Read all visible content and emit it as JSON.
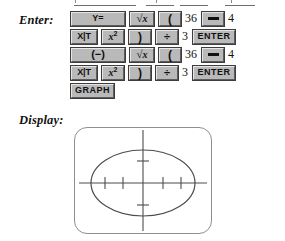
{
  "labels": {
    "enter": "Enter:",
    "display": "Display:"
  },
  "keystrokes": {
    "rows": [
      {
        "items": [
          {
            "kind": "key",
            "name": "y-equals-key",
            "label": "Y=",
            "style": "wide"
          },
          {
            "kind": "key",
            "name": "square-root-key",
            "label": "√x",
            "style": "sqrt"
          },
          {
            "kind": "key",
            "name": "left-paren-key",
            "label": "(",
            "style": "paren"
          },
          {
            "kind": "num",
            "name": "typed-number",
            "label": "36"
          },
          {
            "kind": "key",
            "name": "minus-key",
            "label": "−",
            "style": "minus"
          },
          {
            "kind": "num",
            "name": "typed-number",
            "label": "4"
          }
        ]
      },
      {
        "items": [
          {
            "kind": "key",
            "name": "x-variable-key",
            "label": "X|T",
            "style": "xit"
          },
          {
            "kind": "key",
            "name": "x-squared-key",
            "label": "x2",
            "style": "sq"
          },
          {
            "kind": "key",
            "name": "right-paren-key",
            "label": ")",
            "style": "paren"
          },
          {
            "kind": "key",
            "name": "divide-key",
            "label": "÷",
            "style": "div"
          },
          {
            "kind": "num",
            "name": "typed-number",
            "label": "3"
          },
          {
            "kind": "key",
            "name": "enter-key",
            "label": "ENTER",
            "style": "enter"
          }
        ]
      },
      {
        "items": [
          {
            "kind": "key",
            "name": "negative-key",
            "label": "(−)",
            "style": "neg"
          },
          {
            "kind": "key",
            "name": "square-root-key",
            "label": "√x",
            "style": "sqrt"
          },
          {
            "kind": "key",
            "name": "left-paren-key",
            "label": "(",
            "style": "paren"
          },
          {
            "kind": "num",
            "name": "typed-number",
            "label": "36"
          },
          {
            "kind": "key",
            "name": "minus-key",
            "label": "−",
            "style": "minus"
          },
          {
            "kind": "num",
            "name": "typed-number",
            "label": "4"
          }
        ]
      },
      {
        "items": [
          {
            "kind": "key",
            "name": "x-variable-key",
            "label": "X|T",
            "style": "xit"
          },
          {
            "kind": "key",
            "name": "x-squared-key",
            "label": "x2",
            "style": "sq"
          },
          {
            "kind": "key",
            "name": "right-paren-key",
            "label": ")",
            "style": "paren"
          },
          {
            "kind": "key",
            "name": "divide-key",
            "label": "÷",
            "style": "div"
          },
          {
            "kind": "num",
            "name": "typed-number",
            "label": "3"
          },
          {
            "kind": "key",
            "name": "enter-key",
            "label": "ENTER",
            "style": "enter"
          }
        ]
      },
      {
        "items": [
          {
            "kind": "key",
            "name": "graph-key",
            "label": "GRAPH",
            "style": "graph"
          }
        ]
      }
    ]
  },
  "display": {
    "graph": {
      "type": "ellipse",
      "line_color": "#4c4c4c",
      "axis_color": "#4c4c4c",
      "screen_border_color": "#8f8f8f",
      "x_axis_tick_count": 4,
      "y_axis_tick_count": 2,
      "ellipse_center": [
        0,
        0
      ],
      "ellipse_semi_axis_x": 6,
      "ellipse_semi_axis_y": 4
    }
  }
}
